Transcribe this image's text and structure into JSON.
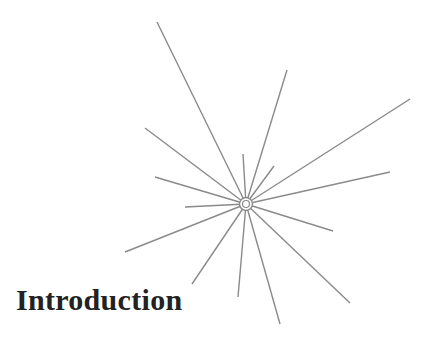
{
  "page": {
    "heading": "Introduction"
  },
  "decoration": {
    "icon": "starburst-icon",
    "stroke_color": "#8a8a8a",
    "center": [
      246,
      204
    ],
    "rays": [
      [
        157,
        22
      ],
      [
        287,
        70
      ],
      [
        410,
        99
      ],
      [
        390,
        172
      ],
      [
        145,
        128
      ],
      [
        155,
        177
      ],
      [
        185,
        207
      ],
      [
        243,
        154
      ],
      [
        274,
        166
      ],
      [
        333,
        231
      ],
      [
        125,
        252
      ],
      [
        192,
        284
      ],
      [
        238,
        297
      ],
      [
        280,
        324
      ],
      [
        350,
        303
      ]
    ]
  }
}
